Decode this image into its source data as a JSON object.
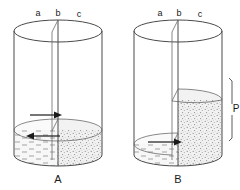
{
  "figure": {
    "title": "",
    "background_color": "#ffffff",
    "line_color": "#4a4a4a",
    "ink_color": "#1a1a1a",
    "liquid_fill_color": "#f4f4f4",
    "granular_fill_color": "#ececec"
  },
  "panels": [
    {
      "id": "A",
      "caption": "A",
      "node_labels": [
        {
          "key": "a",
          "text": "a"
        },
        {
          "key": "b",
          "text": "b"
        },
        {
          "key": "c",
          "text": "c"
        }
      ],
      "left_chamber": {
        "content": "liquid",
        "texture": "dashes",
        "level_label": ""
      },
      "right_chamber": {
        "content": "granular",
        "texture": "stipple",
        "level_label": ""
      },
      "arrows": [
        {
          "name": "upper-arrow",
          "direction": "right"
        },
        {
          "name": "lower-arrow",
          "direction": "left"
        }
      ],
      "measurement": null
    },
    {
      "id": "B",
      "caption": "B",
      "node_labels": [
        {
          "key": "a",
          "text": "a"
        },
        {
          "key": "b",
          "text": "b"
        },
        {
          "key": "c",
          "text": "c"
        }
      ],
      "left_chamber": {
        "content": "liquid",
        "texture": "dashes",
        "level_label": ""
      },
      "right_chamber": {
        "content": "granular",
        "texture": "stipple",
        "level_label": ""
      },
      "arrows": [
        {
          "name": "single-arrow",
          "direction": "right"
        }
      ],
      "measurement": {
        "label": "P",
        "name": "pressure-bracket"
      }
    }
  ]
}
